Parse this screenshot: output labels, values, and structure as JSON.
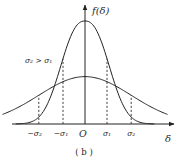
{
  "chart_data": {
    "type": "line",
    "title": "",
    "caption": "( b )",
    "xlabel": "δ",
    "ylabel": "f(δ)",
    "annotation": "σ₂ > σ₁",
    "origin_label": "O",
    "x_tick_labels": [
      "−σ₂",
      "−σ₁",
      "O",
      "σ₁",
      "σ₂"
    ],
    "x_ticks_sigma_units": {
      "neg_sigma2": -2.1,
      "neg_sigma1": -1.0,
      "origin": 0,
      "sigma1": 1.0,
      "sigma2": 2.1
    },
    "xlim": [
      -4.0,
      4.0
    ],
    "ylim": [
      0,
      1.15
    ],
    "series": [
      {
        "name": "σ₁ curve (narrow)",
        "sigma": 1.0,
        "peak": 1.0,
        "dashed_markers_at": [
          -1.0,
          1.0
        ]
      },
      {
        "name": "σ₂ curve (wide)",
        "sigma": 2.1,
        "peak": 0.46,
        "dashed_markers_at": [
          -2.1,
          2.1
        ]
      }
    ],
    "grid": false,
    "legend": "none"
  }
}
